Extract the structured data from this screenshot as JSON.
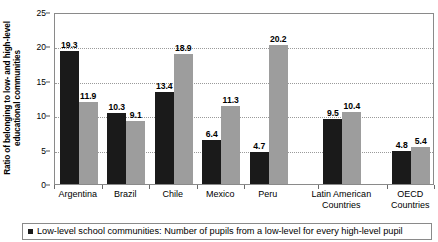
{
  "chart_data": {
    "type": "bar",
    "title": "",
    "xlabel": "",
    "ylabel": "Ratio of belonging to low- and high-level educational communities",
    "ylabel_line1": "Ratio of belonging to low- and high-level",
    "ylabel_line2": "educational communities",
    "ylim": [
      0,
      25
    ],
    "ytick_values": [
      0,
      5,
      10,
      15,
      20,
      25
    ],
    "ytick_labels": [
      "0",
      "5",
      "10",
      "15",
      "20",
      "25"
    ],
    "grid": "horizontal-dotted",
    "legend_position": "bottom",
    "categories": [
      "Argentina",
      "Brazil",
      "Chile",
      "Mexico",
      "Peru",
      "Latin American Countries",
      "OECD Countries"
    ],
    "category_lines": [
      [
        "Argentina"
      ],
      [
        "Brazil"
      ],
      [
        "Chile"
      ],
      [
        "Mexico"
      ],
      [
        "Peru"
      ],
      [
        "Latin American",
        "Countries"
      ],
      [
        "OECD",
        "Countries"
      ]
    ],
    "series": [
      {
        "name": "Low-level school communities",
        "color": "#1a1a1a",
        "values": [
          19.3,
          10.3,
          13.4,
          6.4,
          4.7,
          9.5,
          4.8
        ]
      },
      {
        "name": "High-level school communities",
        "color": "#9d9d9d",
        "values": [
          11.9,
          9.1,
          18.9,
          11.3,
          20.2,
          10.4,
          5.4
        ]
      }
    ],
    "data_labels": {
      "series_0": [
        "19.3",
        "10.3",
        "13.4",
        "6.4",
        "4.7",
        "9.5",
        "4.8"
      ],
      "series_1": [
        "11.9",
        "9.1",
        "18.9",
        "11.3",
        "20.2",
        "10.4",
        "5.4"
      ]
    }
  },
  "legend": {
    "marker": "square-marker",
    "text": "Low-level school communities: Number of pupils from a low-level for every high-level pupil"
  }
}
